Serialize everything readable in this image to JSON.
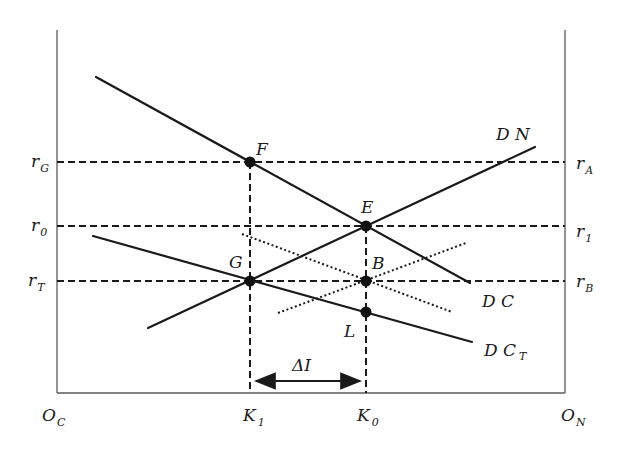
{
  "diagram": {
    "type": "economics two-sector capital allocation diagram",
    "origins": {
      "left": {
        "main": "O",
        "sub": "C"
      },
      "right": {
        "main": "O",
        "sub": "N"
      }
    },
    "left_axis_labels": [
      {
        "id": "rG",
        "main": "r",
        "sub": "G",
        "y": 162
      },
      {
        "id": "r0",
        "main": "r",
        "sub": "0",
        "y": 226
      },
      {
        "id": "rT",
        "main": "r",
        "sub": "T",
        "y": 281
      }
    ],
    "right_axis_labels": [
      {
        "id": "rA",
        "main": "r",
        "sub": "A",
        "y": 162
      },
      {
        "id": "r1",
        "main": "r",
        "sub": "1",
        "y": 226
      },
      {
        "id": "rB",
        "main": "r",
        "sub": "B",
        "y": 281
      }
    ],
    "x_axis_labels": [
      {
        "id": "K1",
        "main": "K",
        "sub": "1",
        "x": 250
      },
      {
        "id": "K0",
        "main": "K",
        "sub": "0",
        "x": 366
      }
    ],
    "points": [
      {
        "label": "F",
        "x": 250,
        "y": 162
      },
      {
        "label": "E",
        "x": 366,
        "y": 226
      },
      {
        "label": "G",
        "x": 250,
        "y": 281
      },
      {
        "label": "B",
        "x": 366,
        "y": 281
      },
      {
        "label": "L",
        "x": 366,
        "y": 312
      }
    ],
    "curves": [
      {
        "label": "DN",
        "style": "solid",
        "from": [
          148,
          328
        ],
        "to": [
          535,
          147
        ]
      },
      {
        "label": "DC",
        "style": "solid",
        "from": [
          96,
          77
        ],
        "to": [
          470,
          283
        ]
      },
      {
        "label": "DC_T",
        "main": "DC",
        "sub": "T",
        "style": "solid",
        "from": [
          93,
          236
        ],
        "to": [
          472,
          342
        ]
      },
      {
        "label": "DC shifted",
        "style": "dotted",
        "from": [
          242,
          234
        ],
        "to": [
          452,
          312
        ]
      },
      {
        "label": "DN shifted",
        "style": "dotted",
        "from": [
          278,
          313
        ],
        "to": [
          466,
          243
        ]
      }
    ],
    "curve_labels": {
      "DN": "D N",
      "DC": "D C",
      "DCT_main": "D C",
      "DCT_sub": "T"
    },
    "arrow": {
      "label": "ΔI",
      "from_x": 250,
      "to_x": 366,
      "y": 381,
      "direction": "both"
    }
  }
}
